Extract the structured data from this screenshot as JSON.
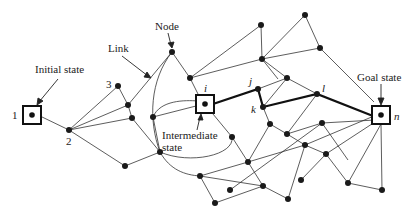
{
  "annotations": {
    "initial_state": "Initial state",
    "link": "Link",
    "node": "Node",
    "intermediate_line1": "Intermediate",
    "intermediate_line2": "state",
    "goal_state": "Goal state"
  },
  "node_labels": {
    "n1": "1",
    "n2": "2",
    "n3": "3",
    "i": "i",
    "j": "j",
    "k": "k",
    "l": "l",
    "n": "n"
  },
  "colors": {
    "line": "#333333",
    "path": "#111111",
    "node": "#1a1a1a"
  }
}
